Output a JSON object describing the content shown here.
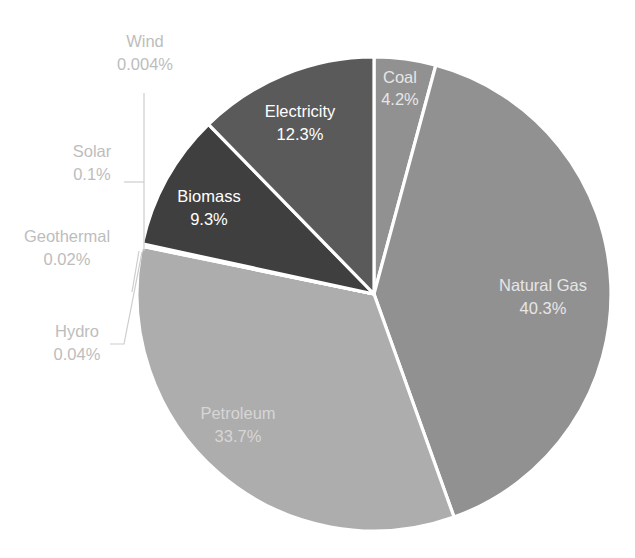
{
  "chart_data": {
    "type": "pie",
    "title": "",
    "subtitle": "",
    "xlabel": "",
    "ylabel": "",
    "legend_position": "none",
    "grid": false,
    "label_format": "name + percent",
    "start_angle_deg": 0,
    "direction": "clockwise",
    "categories": [
      "Coal",
      "Natural Gas",
      "Petroleum",
      "Hydro",
      "Geothermal",
      "Solar",
      "Wind",
      "Biomass",
      "Electricity"
    ],
    "values": [
      4.2,
      40.3,
      33.7,
      0.04,
      0.02,
      0.1,
      0.004,
      9.3,
      12.3
    ],
    "slices": [
      {
        "name": "Coal",
        "label": "Coal",
        "percent": "4.2%",
        "value": 4.2,
        "color": "#919191",
        "label_placement": "inside",
        "label_color": "#dcdcdc"
      },
      {
        "name": "Natural Gas",
        "label": "Natural Gas",
        "percent": "40.3%",
        "value": 40.3,
        "color": "#919191",
        "label_placement": "inside",
        "label_color": "#e2e2e2"
      },
      {
        "name": "Petroleum",
        "label": "Petroleum",
        "percent": "33.7%",
        "value": 33.7,
        "color": "#adadad",
        "label_placement": "inside",
        "label_color": "#dcdcdc"
      },
      {
        "name": "Hydro",
        "label": "Hydro",
        "percent": "0.04%",
        "value": 0.04,
        "color": "#9e9e9e",
        "label_placement": "outside",
        "label_color": "#bdbdbd"
      },
      {
        "name": "Geothermal",
        "label": "Geothermal",
        "percent": "0.02%",
        "value": 0.02,
        "color": "#9e9e9e",
        "label_placement": "outside",
        "label_color": "#bdbdbd"
      },
      {
        "name": "Solar",
        "label": "Solar",
        "percent": "0.1%",
        "value": 0.1,
        "color": "#9e9e9e",
        "label_placement": "outside",
        "label_color": "#bdbdbd"
      },
      {
        "name": "Wind",
        "label": "Wind",
        "percent": "0.004%",
        "value": 0.004,
        "color": "#9e9e9e",
        "label_placement": "outside",
        "label_color": "#bdbdbd"
      },
      {
        "name": "Biomass",
        "label": "Biomass",
        "percent": "9.3%",
        "value": 9.3,
        "color": "#3f3f3f",
        "label_placement": "inside",
        "label_color": "#ffffff"
      },
      {
        "name": "Electricity",
        "label": "Electricity",
        "percent": "12.3%",
        "value": 12.3,
        "color": "#5a5a5a",
        "label_placement": "inside",
        "label_color": "#ffffff"
      }
    ]
  },
  "style": {
    "background": "#ffffff",
    "separator_color": "#ffffff",
    "leader_line_color": "#cdcdcd",
    "outside_label_color": "#bdbdbd",
    "inside_label_color": "#ffffff"
  }
}
